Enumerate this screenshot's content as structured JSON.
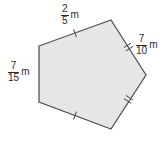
{
  "figure": {
    "shape": "pentagon",
    "fill_color": "#e6e6e6",
    "stroke_color": "#555555",
    "vertices": [
      [
        39,
        46
      ],
      [
        111,
        20
      ],
      [
        146,
        75
      ],
      [
        111,
        129
      ],
      [
        39,
        102
      ]
    ],
    "points_attr": "39,46 111,20 146,75 111,129 39,102"
  },
  "labels": {
    "top": {
      "numerator": "2",
      "denominator": "5",
      "unit": "m"
    },
    "right": {
      "numerator": "7",
      "denominator": "10",
      "unit": "m"
    },
    "left": {
      "numerator": "7",
      "denominator": "15",
      "unit": "m"
    }
  },
  "tick_marks": {
    "top_edge": "single",
    "upper_right_edge": "double",
    "lower_right_edge": "double",
    "bottom_edge": "single",
    "left_edge": "none"
  }
}
